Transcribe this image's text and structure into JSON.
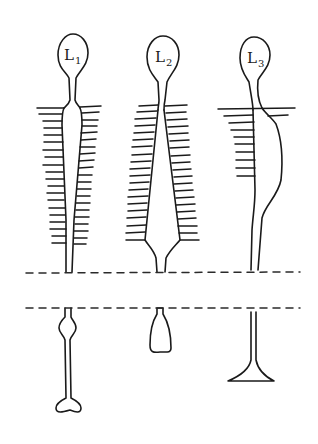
{
  "diagram": {
    "figures": [
      {
        "id": "L1",
        "label": "L",
        "subscript": "1",
        "shaft": "narrow tapering tube with fringe on both sides",
        "end_form": "bone-shaped (dumbbell) terminal"
      },
      {
        "id": "L2",
        "label": "L",
        "subscript": "2",
        "shaft": "wide wedge widening downward with fringe on both sides, narrowing to neck",
        "end_form": "bottle-shaped terminal"
      },
      {
        "id": "L3",
        "label": "L",
        "subscript": "3",
        "shaft": "asymmetric bulge to the right with fringe on left side only",
        "end_form": "flared trumpet/foot terminal"
      }
    ],
    "dividers": [
      {
        "name": "upper-dashed-line",
        "style": "dashed"
      },
      {
        "name": "lower-dashed-line",
        "style": "dashed"
      }
    ],
    "colors": {
      "ink": "#1a1a1a",
      "background": "#ffffff"
    }
  }
}
